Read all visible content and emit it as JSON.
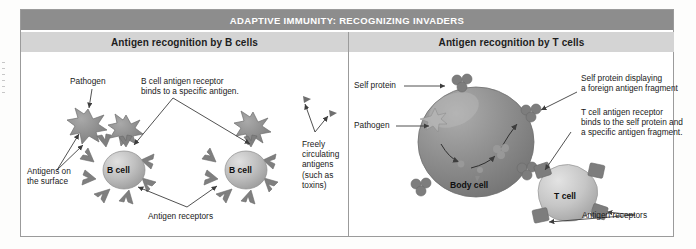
{
  "figure": {
    "banner_title": "ADAPTIVE IMMUNITY: RECOGNIZING INVADERS",
    "panels": [
      {
        "id": "b-cells",
        "header": "Antigen recognition by B cells",
        "labels": {
          "pathogen": "Pathogen",
          "receptor_binds": "B cell antigen receptor\nbinds to a specific antigen.",
          "antigens_surface": "Antigens on\nthe surface",
          "free_antigens": "Freely\ncirculating\nantigens\n(such as\ntoxins)",
          "antigen_receptors": "Antigen receptors"
        },
        "cells": [
          {
            "name": "B cell"
          },
          {
            "name": "B cell"
          }
        ]
      },
      {
        "id": "t-cells",
        "header": "Antigen recognition by T cells",
        "labels": {
          "self_protein": "Self protein",
          "pathogen": "Pathogen",
          "self_protein_displaying": "Self protein displaying\na foreign antigen fragment",
          "t_receptor_binds": "T cell antigen receptor\nbinds to the self protein and\na specific antigen fragment.",
          "antigen_receptors": "Antigen receptors"
        },
        "cells": [
          {
            "name": "Body cell"
          },
          {
            "name": "T cell"
          }
        ]
      }
    ],
    "colors": {
      "banner_bg": "#8d8d8d",
      "banner_text": "#ffffff",
      "subheader_bg": "#d4d4d4",
      "frame_border": "#9b9b9b",
      "pathogen": "#8f8f8f",
      "b_cell": "#b9b9b9",
      "body_cell": "#8a8a8a",
      "t_cell": "#c2c2c2",
      "receptor": "#7f7f7f",
      "leader_line": "#4a4a4a"
    }
  }
}
